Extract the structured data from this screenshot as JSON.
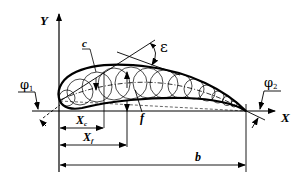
{
  "diagram": {
    "axes": {
      "x_label": "X",
      "y_label": "Y"
    },
    "labels": {
      "camber_label": "c",
      "max_thickness_label": "f",
      "angle_epsilon": "ε",
      "inlet_angle": "φ",
      "inlet_angle_sub": "1",
      "outlet_angle": "φ",
      "outlet_angle_sub": "2",
      "xc_label": "X",
      "xc_sub": "c",
      "xf_label": "X",
      "xf_sub": "f",
      "chord_label": "b"
    },
    "colors": {
      "stroke": "#000000",
      "background": "#ffffff"
    }
  }
}
